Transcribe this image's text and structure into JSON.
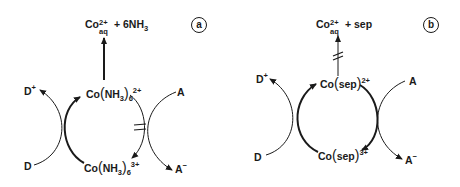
{
  "panels": [
    {
      "id": "a",
      "label": "a",
      "product": {
        "metal": "Co",
        "charge": "2+",
        "sub": "aq",
        "rest": " + 6NH",
        "rest_sub": "3"
      },
      "top_complex": {
        "metal": "Co",
        "ligand": "NH",
        "ligand_sub": "3",
        "count": "6",
        "charge": "2+"
      },
      "bottom_complex": {
        "metal": "Co",
        "ligand": "NH",
        "ligand_sub": "3",
        "count": "6",
        "charge": "3+"
      },
      "donor": "D",
      "donor_ox": "D",
      "donor_ox_charge": "+",
      "acceptor": "A",
      "acceptor_red": "A",
      "acceptor_red_charge": "−",
      "blocked_step": "reduction of A by Co(NH3)6 2+ (blocked)",
      "dissociation": "fast"
    },
    {
      "id": "b",
      "label": "b",
      "product": {
        "metal": "Co",
        "charge": "2+",
        "sub": "aq",
        "rest": " + sep"
      },
      "top_complex": {
        "metal": "Co",
        "ligand": "sep",
        "charge": "2+"
      },
      "bottom_complex": {
        "metal": "Co",
        "ligand": "sep",
        "charge": "3+"
      },
      "donor": "D",
      "donor_ox": "D",
      "donor_ox_charge": "+",
      "acceptor": "A",
      "acceptor_red": "A",
      "acceptor_red_charge": "−",
      "blocked_step": "dissociation of Co(sep) 2+ (blocked)",
      "dissociation": "blocked"
    }
  ],
  "colors": {
    "ink": "#1a1a1a",
    "background": "#ffffff"
  }
}
